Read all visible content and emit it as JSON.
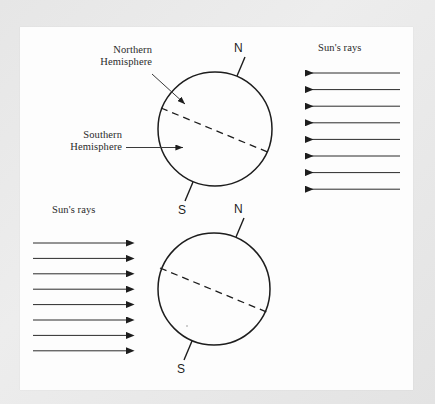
{
  "figure": {
    "type": "diagram",
    "background_color": "#e9e9e9",
    "page_color": "#fdfdfd",
    "ink_color": "#1d1d1d"
  },
  "labels": {
    "northern_hemisphere": "Northern\nHemisphere",
    "southern_hemisphere": "Southern\nHemisphere",
    "suns_rays_right": "Sun's rays",
    "suns_rays_left": "Sun's rays",
    "top_north_pole": "N",
    "top_south_pole": "S",
    "bottom_north_pole": "N",
    "bottom_south_pole": "S"
  },
  "diagram_data": {
    "globes": [
      {
        "id": "top-globe",
        "center_x": 215,
        "center_y": 129,
        "radius": 57,
        "axis_tilt_degrees": 23.5,
        "north_pole_label": "N",
        "south_pole_label": "S",
        "equator_style": "dashed",
        "equator_tilt_degrees": 23.5,
        "illuminated_side": "right",
        "callouts": [
          "Northern Hemisphere",
          "Southern Hemisphere"
        ]
      },
      {
        "id": "bottom-globe",
        "center_x": 214,
        "center_y": 289,
        "radius": 56,
        "axis_tilt_degrees": 23.5,
        "north_pole_label": "N",
        "south_pole_label": "S",
        "equator_style": "dashed",
        "equator_tilt_degrees": 23.5,
        "illuminated_side": "left",
        "callouts": []
      }
    ],
    "ray_groups": [
      {
        "id": "right-rays",
        "label": "Sun's rays",
        "direction": "left",
        "count": 8,
        "x_start": 400,
        "x_end": 305,
        "y_first": 73,
        "y_spacing": 16.6
      },
      {
        "id": "left-rays",
        "label": "Sun's rays",
        "direction": "right",
        "count": 8,
        "x_start": 33,
        "x_end": 126,
        "y_first": 243,
        "y_spacing": 15.4
      }
    ],
    "callout_lines": [
      {
        "label": "Northern Hemisphere",
        "from": [
          152,
          74
        ],
        "to": [
          187,
          106
        ],
        "arrowhead": true
      },
      {
        "label": "Southern Hemisphere",
        "from": [
          126,
          147
        ],
        "to": [
          186,
          148
        ],
        "arrowhead": true
      }
    ]
  }
}
